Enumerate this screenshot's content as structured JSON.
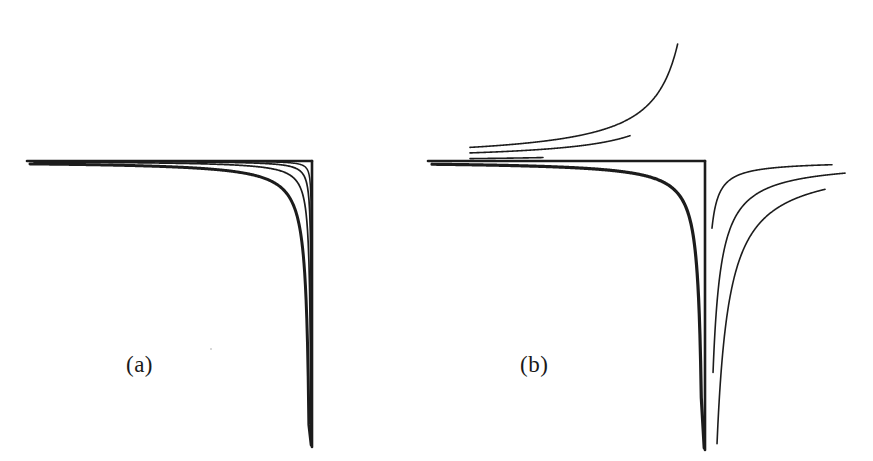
{
  "figure": {
    "kind": "line-diagram",
    "background": "#ffffff",
    "ink": "#1c1c1c",
    "width": 873,
    "height": 461,
    "panels": [
      {
        "id": "a",
        "label": "(a)",
        "label_x": 126,
        "label_y": 352
      },
      {
        "id": "b",
        "label": "(b)",
        "label_y": 352,
        "label_x": 520
      }
    ]
  },
  "chart_data": {
    "type": "line",
    "title": "",
    "subtitle": "",
    "xlabel": "",
    "ylabel": "",
    "grid": false,
    "legend": null,
    "axes_style": "asymptote-corner",
    "panels": [
      {
        "id": "a",
        "label": "(a)",
        "corner": {
          "x": 312,
          "y": 161
        },
        "horizontal_asymptote": {
          "x_start": 27,
          "x_end": 312,
          "y": 161
        },
        "vertical_asymptote": {
          "x": 312,
          "y_start": 161,
          "y_end": 447
        },
        "series": [
          {
            "name": "curve-1-outer",
            "branch": "inside",
            "weight": 3.0,
            "k": 820,
            "x_start": 30,
            "x_end": 311,
            "y_end": 445
          },
          {
            "name": "curve-2",
            "branch": "inside",
            "weight": 1.7,
            "k": 310,
            "x_start": 34,
            "x_end": 311,
            "y_end": 445
          },
          {
            "name": "curve-3",
            "branch": "inside",
            "weight": 1.7,
            "k": 118,
            "x_start": 40,
            "x_end": 311,
            "y_end": 445
          },
          {
            "name": "curve-4-inner",
            "branch": "inside",
            "weight": 1.5,
            "k": 40,
            "x_start": 48,
            "x_end": 311,
            "y_end": 445
          }
        ]
      },
      {
        "id": "b",
        "label": "(b)",
        "corner": {
          "x": 705,
          "y": 161
        },
        "horizontal_asymptote": {
          "x_start": 428,
          "x_end": 705,
          "y": 161
        },
        "vertical_asymptote": {
          "x": 705,
          "y_start": 161,
          "y_end": 450
        },
        "convergence_left": {
          "x": 470,
          "y": 162
        },
        "convergence_bottom": {
          "x": 705,
          "y": 450
        },
        "series": [
          {
            "name": "curve-main-inside",
            "branch": "inside",
            "weight": 3.2,
            "k": 880,
            "x_start": 432,
            "x_end": 704,
            "y_end": 448
          },
          {
            "name": "curve-upper-1",
            "branch": "above",
            "weight": 1.6,
            "k": 560,
            "x_start": 470,
            "x_end": 543,
            "y_end": 43
          },
          {
            "name": "curve-upper-2",
            "branch": "above",
            "weight": 1.6,
            "k": 1900,
            "x_start": 470,
            "x_end": 630,
            "y_end": 25
          },
          {
            "name": "curve-upper-3",
            "branch": "above",
            "weight": 1.6,
            "k": 3200,
            "x_start": 470,
            "x_end": 688,
            "y_end": 42
          },
          {
            "name": "curve-right-1",
            "branch": "right",
            "weight": 1.6,
            "k": 470,
            "x_start": 712,
            "x_end": 832,
            "y_start": 265
          },
          {
            "name": "curve-right-2",
            "branch": "right",
            "weight": 1.6,
            "k": 1700,
            "x_start": 710,
            "x_end": 845,
            "y_start": 380
          },
          {
            "name": "curve-right-3",
            "branch": "right",
            "weight": 1.6,
            "k": 3400,
            "x_start": 707,
            "x_end": 825,
            "y_start": 445
          }
        ]
      }
    ]
  }
}
